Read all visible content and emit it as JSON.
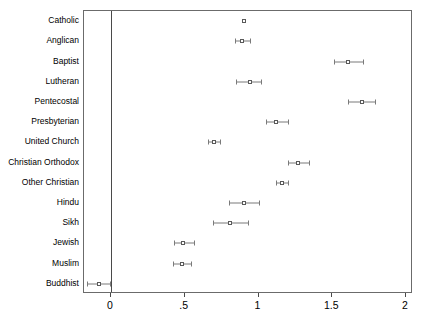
{
  "chart_data": {
    "type": "scatter",
    "title": "",
    "subtitle": "",
    "xlabel": "",
    "ylabel": "",
    "xlim": [
      -0.18,
      2.0
    ],
    "ylim": [
      0,
      14
    ],
    "grid": false,
    "legend": null,
    "reference_line": 0,
    "x_ticks": [
      {
        "value": 0,
        "label": "0"
      },
      {
        "value": 0.5,
        "label": ".5"
      },
      {
        "value": 1,
        "label": "1"
      },
      {
        "value": 1.5,
        "label": "1.5"
      },
      {
        "value": 2,
        "label": "2"
      }
    ],
    "categories": [
      "Catholic",
      "Anglican",
      "Baptist",
      "Lutheran",
      "Pentecostal",
      "Presbyterian",
      "United Church",
      "Christian Orthodox",
      "Other Christian",
      "Hindu",
      "Sikh",
      "Jewish",
      "Muslim",
      "Buddhist"
    ],
    "points": [
      {
        "category": "Catholic",
        "estimate": 0.9,
        "ci_low": 0.9,
        "ci_high": 0.9
      },
      {
        "category": "Anglican",
        "estimate": 0.89,
        "ci_low": 0.84,
        "ci_high": 0.94
      },
      {
        "category": "Baptist",
        "estimate": 1.61,
        "ci_low": 1.51,
        "ci_high": 1.71
      },
      {
        "category": "Lutheran",
        "estimate": 0.94,
        "ci_low": 0.85,
        "ci_high": 1.02
      },
      {
        "category": "Pentecostal",
        "estimate": 1.7,
        "ci_low": 1.61,
        "ci_high": 1.79
      },
      {
        "category": "Presbyterian",
        "estimate": 1.12,
        "ci_low": 1.05,
        "ci_high": 1.2
      },
      {
        "category": "United Church",
        "estimate": 0.7,
        "ci_low": 0.66,
        "ci_high": 0.74
      },
      {
        "category": "Christian Orthodox",
        "estimate": 1.27,
        "ci_low": 1.2,
        "ci_high": 1.34
      },
      {
        "category": "Other Christian",
        "estimate": 1.16,
        "ci_low": 1.12,
        "ci_high": 1.2
      },
      {
        "category": "Hindu",
        "estimate": 0.9,
        "ci_low": 0.8,
        "ci_high": 1.0
      },
      {
        "category": "Sikh",
        "estimate": 0.81,
        "ci_low": 0.69,
        "ci_high": 0.93
      },
      {
        "category": "Jewish",
        "estimate": 0.49,
        "ci_low": 0.43,
        "ci_high": 0.56
      },
      {
        "category": "Muslim",
        "estimate": 0.48,
        "ci_low": 0.42,
        "ci_high": 0.54
      },
      {
        "category": "Buddhist",
        "estimate": -0.08,
        "ci_low": -0.16,
        "ci_high": -0.01
      }
    ]
  },
  "colors": {
    "marker_edge": "#5a5a5a",
    "marker_fill": "#ffffff",
    "ci": "#7a7a7a",
    "frame": "#6b6b6b",
    "reference_line": "#4a4a4a",
    "background": "#ffffff",
    "text": "#000000"
  }
}
